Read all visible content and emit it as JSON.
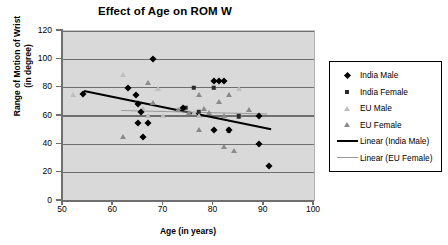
{
  "chart_data": {
    "type": "scatter",
    "title": "Effect of Age on ROM W",
    "xlabel": "Age (in years)",
    "ylabel": "Range of Motion of Wrist (in degree)",
    "ylabel_line1": "Range of Motion of Wrist",
    "ylabel_line2": "(in degree)",
    "xlim": [
      50,
      100
    ],
    "ylim": [
      0,
      120
    ],
    "xticks": [
      50,
      60,
      70,
      80,
      90,
      100
    ],
    "yticks": [
      0,
      20,
      40,
      60,
      80,
      100,
      120
    ],
    "grid": "horizontal",
    "legend_position": "right",
    "plot_background": "#d9d9d9",
    "series": [
      {
        "name": "India Male",
        "marker": "diamond",
        "color": "#000000",
        "points": [
          [
            54,
            75.5
          ],
          [
            63,
            80
          ],
          [
            65,
            68.5
          ],
          [
            64.5,
            75
          ],
          [
            65.5,
            62.5
          ],
          [
            65,
            55
          ],
          [
            67,
            55
          ],
          [
            66,
            45
          ],
          [
            68,
            100
          ],
          [
            74,
            65.5
          ],
          [
            80,
            84.5
          ],
          [
            81,
            84.5
          ],
          [
            82,
            84.5
          ],
          [
            80,
            50
          ],
          [
            83,
            50
          ],
          [
            89,
            60
          ],
          [
            89,
            40
          ],
          [
            91,
            24.5
          ]
        ]
      },
      {
        "name": "India Female",
        "marker": "square",
        "color": "#2b2b2b",
        "points": [
          [
            74.5,
            66
          ],
          [
            76,
            80
          ],
          [
            77,
            63
          ],
          [
            80,
            80
          ],
          [
            83,
            50
          ],
          [
            85,
            60
          ]
        ]
      },
      {
        "name": "EU Male",
        "marker": "triangle",
        "color": "#bfbfbf",
        "points": [
          [
            52,
            74.5
          ],
          [
            62,
            89
          ],
          [
            66,
            65
          ],
          [
            67,
            60
          ],
          [
            69,
            79
          ],
          [
            70,
            60
          ],
          [
            76,
            62
          ],
          [
            77,
            60
          ],
          [
            80,
            80
          ],
          [
            85,
            79
          ],
          [
            85,
            60
          ]
        ]
      },
      {
        "name": "EU Female",
        "marker": "triangle",
        "color": "#8a8a8a",
        "points": [
          [
            62,
            45.5
          ],
          [
            67,
            83
          ],
          [
            68,
            69
          ],
          [
            73,
            64
          ],
          [
            75,
            62
          ],
          [
            77,
            75
          ],
          [
            77,
            50
          ],
          [
            78,
            65
          ],
          [
            79,
            62
          ],
          [
            81,
            70
          ],
          [
            82,
            60
          ],
          [
            83,
            75
          ],
          [
            82,
            38
          ],
          [
            84,
            35
          ],
          [
            87,
            64
          ]
        ]
      }
    ],
    "trendlines": [
      {
        "name": "Linear (India Male)",
        "color": "#000000",
        "x_start": 54.2,
        "y_start": 78.5,
        "x_end": 91.5,
        "y_end": 51.5
      },
      {
        "name": "Linear (EU Female)",
        "color": "#9a9a9a",
        "x_start": 61.5,
        "y_start": 64.5,
        "x_end": 90.5,
        "y_end": 62.0
      }
    ],
    "legend_entries": [
      {
        "label": "India Male",
        "key": "diamond-marker-icon"
      },
      {
        "label": "India Female",
        "key": "square-marker-icon"
      },
      {
        "label": "EU Male",
        "key": "triangle-light-marker-icon"
      },
      {
        "label": "EU Female",
        "key": "triangle-dark-marker-icon"
      },
      {
        "label": "Linear (India Male)",
        "key": "black-line-icon"
      },
      {
        "label": "Linear (EU Female)",
        "key": "gray-line-icon"
      }
    ]
  }
}
